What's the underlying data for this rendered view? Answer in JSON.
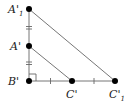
{
  "diagram": {
    "type": "geometry-similar-triangles",
    "points": [
      {
        "id": "A1p",
        "label": "A'",
        "subscript": "1",
        "x": 29,
        "y": 9
      },
      {
        "id": "Ap",
        "label": "A'",
        "subscript": "",
        "x": 29,
        "y": 46
      },
      {
        "id": "Bp",
        "label": "B'",
        "subscript": "",
        "x": 29,
        "y": 81
      },
      {
        "id": "Cp",
        "label": "C'",
        "subscript": "",
        "x": 72,
        "y": 81
      },
      {
        "id": "C1p",
        "label": "C'",
        "subscript": "1",
        "x": 115,
        "y": 81
      }
    ],
    "segments": [
      [
        "A1p",
        "Bp"
      ],
      [
        "Bp",
        "C1p"
      ],
      [
        "A1p",
        "C1p"
      ],
      [
        "Ap",
        "Cp"
      ]
    ],
    "tick_marks": [
      {
        "segment": [
          "A1p",
          "Ap"
        ],
        "count": 2
      },
      {
        "segment": [
          "Ap",
          "Bp"
        ],
        "count": 2
      },
      {
        "segment": [
          "Bp",
          "Cp"
        ],
        "count": 1
      },
      {
        "segment": [
          "Cp",
          "C1p"
        ],
        "count": 1
      }
    ],
    "right_angle_at": "Bp",
    "colors": {
      "line": "#555555",
      "point": "#000000"
    }
  }
}
